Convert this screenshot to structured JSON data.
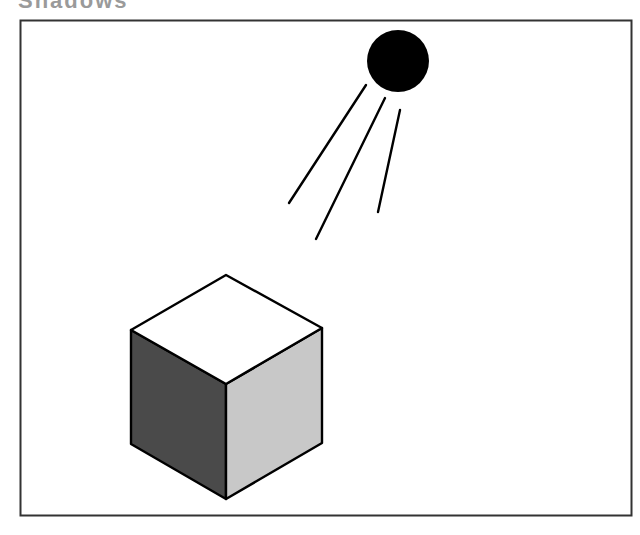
{
  "figure": {
    "frame": {
      "x": 20,
      "y": 20,
      "width": 611,
      "height": 495,
      "stroke": "#333333"
    },
    "sun": {
      "cx": 398,
      "cy": 61,
      "r": 31,
      "fill": "#000000"
    },
    "rays": [
      {
        "x1": 366,
        "y1": 85,
        "x2": 289,
        "y2": 203
      },
      {
        "x1": 385,
        "y1": 98,
        "x2": 316,
        "y2": 239
      },
      {
        "x1": 400,
        "y1": 110,
        "x2": 378,
        "y2": 212
      }
    ],
    "cube": {
      "top_face_color": "#ffffff",
      "left_face_color": "#4a4a4a",
      "right_face_color": "#c8c8c8",
      "edge_color": "#000000"
    }
  },
  "captions": {
    "top_clipped": "Shadows",
    "bottom_clipped": ""
  }
}
